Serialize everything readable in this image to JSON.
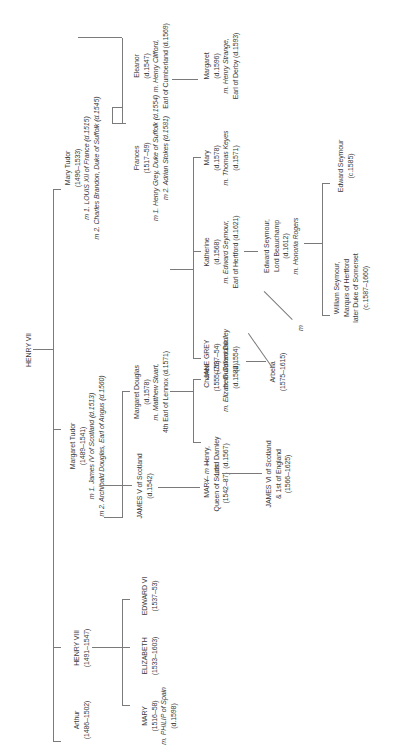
{
  "diagram": {
    "orientation": "rotated 90° counter-clockwise",
    "root": {
      "name": "HENRY VII"
    },
    "generation1": [
      {
        "name": "Mary Tudor",
        "dates": "(1496–1533)",
        "spouses": [
          "m 1. LOUIS XII of France (d.1515)",
          "m 2. Charles Brandon, Duke of Suffolk (d.1545)"
        ]
      },
      {
        "name": "Margaret Tudor",
        "dates": "(1489–1541)",
        "spouses": [
          "m 1. James IV of Scotland (d.1513)",
          "m 2. Archibald Douglas, Earl of Angus (d.1560)"
        ]
      },
      {
        "name": "HENRY VIII",
        "dates": "(1491–1547)"
      },
      {
        "name": "Arthur",
        "dates": "(1486–1502)"
      }
    ],
    "generation2": [
      {
        "name": "Eleanor",
        "dates": "(d.1547)",
        "spouse": "m. Henry Clifford,",
        "spouse2": "Earl of Cumberland (d.1569)"
      },
      {
        "name": "Frances",
        "dates": "(1517–59)",
        "spouses": [
          "m 1. Henry Grey, Duke of Suffolk (d.1554)",
          "m 2. Adrian Stokes (d.1581)"
        ]
      },
      {
        "name": "Margaret Douglas",
        "dates": "(d.1578)",
        "spouse": "m. Matthew Stuart,",
        "spouse2": "4th Earl of Lennox (d.1571)"
      },
      {
        "name": "JAMES V of Scotland",
        "dates": "(d.1542)"
      },
      {
        "name": "EDWARD VI",
        "dates": "(1537–53)"
      },
      {
        "name": "ELIZABETH",
        "dates": "(1533–1603)"
      },
      {
        "name": "MARY",
        "dates": "(1516–58)",
        "spouse": "m. PHILIP of Spain",
        "spouse2": "(d.1598)"
      }
    ],
    "generation3": [
      {
        "name": "Margaret",
        "dates": "(d.1596)",
        "spouse": "m. Henry Strange,",
        "spouse2": "Earl of Derby (d.1593)"
      },
      {
        "name": "Mary",
        "dates": "(d.1578)",
        "spouse": "m. Thomas Keyes",
        "spouse2": "(d.1571)"
      },
      {
        "name": "Katherine",
        "dates": "(d.1568)",
        "spouse": "m. Edward Seymour,",
        "spouse2": "Earl of Hertford (d.1621)"
      },
      {
        "name": "JANE GREY",
        "dates": "(1537–54)",
        "spouse": "m. Guildford Dudley",
        "spouse2": "(d.1554)"
      },
      {
        "name": "Charles",
        "dates": "(1555–76)",
        "spouse": "m. Elizabeth Cavendish",
        "spouse2": "(d.1582)"
      },
      {
        "name": "Henry,",
        "dates": "Lord Darnley",
        "extra": "(d.1567)"
      },
      {
        "name": "MARY",
        "dates": "Queen of Scots",
        "extra": "(1542–87)"
      }
    ],
    "generation4": [
      {
        "name": "Edward Seymour,",
        "line2": "Lord Beauchamp",
        "dates": "(d.1612)",
        "spouse": "m. Honoria Rogers"
      },
      {
        "name": "Arbella",
        "dates": "(1575–1615)"
      },
      {
        "name": "JAMES VI of Scotland",
        "line2": "& 1st of England",
        "dates": "(1566–1625)"
      }
    ],
    "generation5": [
      {
        "name": "Edward Seymour",
        "dates": "(c.1585)"
      },
      {
        "name": "William Seymour,",
        "line2": "Marquis of Hertford",
        "line3": "later Duke of Somerset",
        "dates": "(c.1587–1660)"
      }
    ],
    "marriage_marker": "m",
    "marriage_marker_darnley": "— m —"
  }
}
